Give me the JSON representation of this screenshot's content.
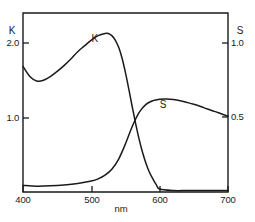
{
  "chart_data": {
    "type": "line",
    "title": "",
    "xlabel": "nm",
    "ylabel": "K",
    "ylabel_right": "S",
    "xlim": [
      400,
      700
    ],
    "xticks": [
      400,
      500,
      600,
      700
    ],
    "xticklabels": [
      "400",
      "500",
      "600",
      "700"
    ],
    "ylim": [
      0,
      2.45
    ],
    "yticks": [
      1.0,
      2.0
    ],
    "yticklabels": [
      "1.0",
      "2.0"
    ],
    "ylim_right": [
      0,
      1.225
    ],
    "yticks_right": [
      0.5,
      1.0
    ],
    "yticklabels_right": [
      "0.5",
      "1.0"
    ],
    "grid": false,
    "legend": "inline-annotations",
    "series": [
      {
        "name": "K",
        "axis": "left",
        "annotation": "K",
        "x": [
          400,
          410,
          420,
          430,
          440,
          450,
          460,
          470,
          480,
          490,
          500,
          510,
          520,
          525,
          530,
          535,
          540,
          545,
          550,
          555,
          560,
          565,
          570,
          575,
          580,
          585,
          590,
          595,
          600,
          620,
          640,
          660,
          680,
          700
        ],
        "y": [
          1.72,
          1.58,
          1.52,
          1.53,
          1.58,
          1.65,
          1.73,
          1.82,
          1.92,
          2.0,
          2.08,
          2.14,
          2.17,
          2.17,
          2.14,
          2.08,
          1.98,
          1.83,
          1.63,
          1.4,
          1.16,
          0.93,
          0.72,
          0.54,
          0.39,
          0.27,
          0.18,
          0.1,
          0.04,
          0.02,
          0.02,
          0.02,
          0.02,
          0.02
        ]
      },
      {
        "name": "S",
        "axis": "right",
        "annotation": "S",
        "x": [
          400,
          420,
          440,
          460,
          480,
          500,
          510,
          520,
          530,
          540,
          550,
          560,
          570,
          580,
          590,
          600,
          610,
          620,
          630,
          640,
          650,
          660,
          670,
          680,
          690,
          700
        ],
        "y": [
          0.045,
          0.04,
          0.042,
          0.048,
          0.058,
          0.075,
          0.09,
          0.115,
          0.155,
          0.225,
          0.33,
          0.45,
          0.545,
          0.6,
          0.625,
          0.635,
          0.637,
          0.633,
          0.625,
          0.613,
          0.6,
          0.585,
          0.568,
          0.552,
          0.535,
          0.518
        ]
      }
    ],
    "annotations": [
      {
        "text": "K",
        "x": 505,
        "y_left": 2.05
      },
      {
        "text": "S",
        "x": 605,
        "y_right": 0.575
      }
    ]
  },
  "axes": {
    "left_axis_name": "K",
    "right_axis_name": "S",
    "x_axis_title": "nm"
  }
}
